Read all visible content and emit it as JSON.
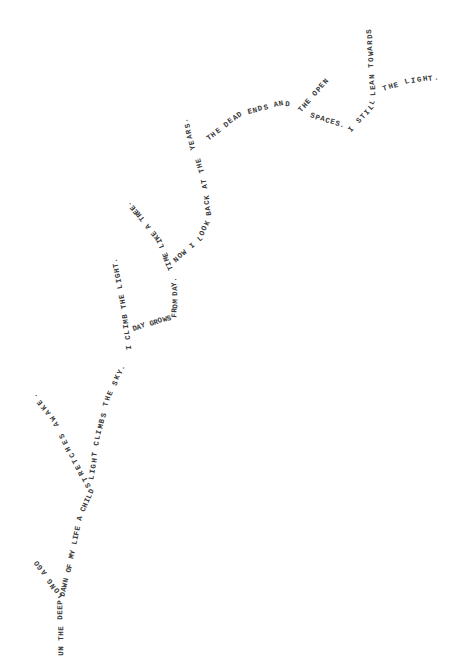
{
  "poem": {
    "segments": [
      {
        "id": "trunk-1",
        "text": "UN THE DEEP",
        "points": [
          [
            62,
            656
          ],
          [
            61,
            600
          ]
        ]
      },
      {
        "id": "branch-long-ago",
        "text": "LONG AGO",
        "points": [
          [
            62,
            597
          ],
          [
            52,
            583
          ],
          [
            36,
            560
          ]
        ]
      },
      {
        "id": "trunk-2",
        "text": "DAWN OF MY LIFE A CHILD",
        "points": [
          [
            63,
            597
          ],
          [
            72,
            560
          ],
          [
            80,
            520
          ],
          [
            93,
            490
          ]
        ]
      },
      {
        "id": "branch-stretches",
        "text": "STRETCHES AWAKE.",
        "points": [
          [
            90,
            487
          ],
          [
            70,
            450
          ],
          [
            55,
            420
          ],
          [
            33,
            393
          ]
        ]
      },
      {
        "id": "trunk-3",
        "text": "LIGHT CLIMBS THE SKY.",
        "points": [
          [
            92,
            480
          ],
          [
            98,
            440
          ],
          [
            108,
            400
          ],
          [
            125,
            365
          ]
        ]
      },
      {
        "id": "branch-climb",
        "text": "I CLIMB THE LIGHT.",
        "points": [
          [
            130,
            350
          ],
          [
            125,
            310
          ],
          [
            118,
            275
          ],
          [
            115,
            258
          ]
        ]
      },
      {
        "id": "trunk-4",
        "text": "DAY GROWS FROM DAY.",
        "points": [
          [
            133,
            330
          ],
          [
            160,
            322
          ],
          [
            175,
            318
          ],
          [
            176,
            300
          ],
          [
            175,
            278
          ]
        ]
      },
      {
        "id": "branch-time",
        "text": "TIME LIKE A TREE.",
        "points": [
          [
            172,
            270
          ],
          [
            160,
            240
          ],
          [
            140,
            215
          ],
          [
            128,
            202
          ]
        ]
      },
      {
        "id": "trunk-5",
        "text": "NOW I LOOK BACK AT THE",
        "points": [
          [
            175,
            262
          ],
          [
            200,
            240
          ],
          [
            210,
            220
          ],
          [
            205,
            180
          ],
          [
            198,
            158
          ]
        ]
      },
      {
        "id": "branch-years",
        "text": "YEARS.",
        "points": [
          [
            194,
            150
          ],
          [
            188,
            126
          ],
          [
            185,
            118
          ]
        ]
      },
      {
        "id": "trunk-6",
        "text": "THE DEAD ENDS AND",
        "points": [
          [
            208,
            140
          ],
          [
            240,
            115
          ],
          [
            280,
            105
          ],
          [
            290,
            106
          ]
        ]
      },
      {
        "id": "branch-open",
        "text": "THE OPEN",
        "points": [
          [
            300,
            112
          ],
          [
            320,
            90
          ],
          [
            328,
            80
          ]
        ]
      },
      {
        "id": "trunk-7",
        "text": "SPACES.",
        "points": [
          [
            310,
            116
          ],
          [
            340,
            125
          ],
          [
            345,
            127
          ]
        ]
      },
      {
        "id": "trunk-8",
        "text": "I STILL",
        "points": [
          [
            350,
            132
          ],
          [
            370,
            110
          ],
          [
            375,
            100
          ]
        ]
      },
      {
        "id": "branch-lean",
        "text": "LEAN TOWARDS",
        "points": [
          [
            374,
            96
          ],
          [
            372,
            60
          ],
          [
            370,
            28
          ]
        ]
      },
      {
        "id": "trunk-9",
        "text": "THE LIGHT.",
        "points": [
          [
            383,
            90
          ],
          [
            410,
            82
          ],
          [
            440,
            78
          ]
        ]
      }
    ]
  },
  "colors": {
    "text": "#3a3a3a",
    "background": "#ffffff"
  }
}
